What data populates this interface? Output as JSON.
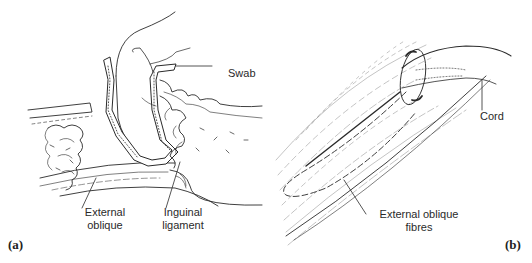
{
  "figure": {
    "panels": [
      {
        "id": "a",
        "tag": "(a)",
        "labels": {
          "swab": "Swab",
          "external_oblique_line1": "External",
          "external_oblique_line2": "oblique",
          "inguinal_ligament_line1": "Inguinal",
          "inguinal_ligament_line2": "ligament"
        }
      },
      {
        "id": "b",
        "tag": "(b)",
        "labels": {
          "cord": "Cord",
          "external_oblique_fibres_line1": "External oblique",
          "external_oblique_fibres_line2": "fibres"
        }
      }
    ],
    "colors": {
      "ink": "#2a2a2a",
      "background": "#ffffff"
    }
  }
}
